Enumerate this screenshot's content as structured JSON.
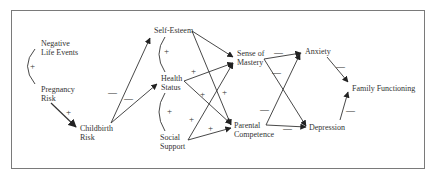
{
  "diagram": {
    "type": "path-model",
    "nodes": {
      "negative_life_events": {
        "line1": "Negative",
        "line2": "Life Events"
      },
      "pregnancy_risk": {
        "line1": "Pregnancy",
        "line2": "Risk"
      },
      "childbirth_risk": {
        "line1": "Childbirth",
        "line2": "Risk"
      },
      "self_esteem": {
        "line1": "Self-Esteem"
      },
      "health_status": {
        "line1": "Health",
        "line2": "Status"
      },
      "social_support": {
        "line1": "Social",
        "line2": "Support"
      },
      "sense_of_mastery": {
        "line1": "Sense of",
        "line2": "Mastery"
      },
      "parental_competence": {
        "line1": "Parental",
        "line2": "Competence"
      },
      "anxiety": {
        "line1": "Anxiety"
      },
      "depression": {
        "line1": "Depression"
      },
      "family_functioning": {
        "line1": "Family Functioning"
      }
    },
    "signs": {
      "plus": "+",
      "minus": "—"
    },
    "edges": [
      {
        "from": "Negative Life Events",
        "to": "Pregnancy Risk",
        "kind": "correlation",
        "sign": "+"
      },
      {
        "from": "Pregnancy Risk",
        "to": "Childbirth Risk",
        "kind": "path",
        "sign": "+"
      },
      {
        "from": "Childbirth Risk",
        "to": "Self-Esteem",
        "kind": "path",
        "sign": "−"
      },
      {
        "from": "Childbirth Risk",
        "to": "Health Status",
        "kind": "path",
        "sign": "−"
      },
      {
        "from": "Self-Esteem",
        "to": "Health Status",
        "kind": "correlation",
        "sign": "+"
      },
      {
        "from": "Health Status",
        "to": "Social Support",
        "kind": "correlation",
        "sign": "+"
      },
      {
        "from": "Self-Esteem",
        "to": "Sense of Mastery",
        "kind": "path",
        "sign": ""
      },
      {
        "from": "Self-Esteem",
        "to": "Parental Competence",
        "kind": "path",
        "sign": "+"
      },
      {
        "from": "Health Status",
        "to": "Sense of Mastery",
        "kind": "path",
        "sign": "+"
      },
      {
        "from": "Health Status",
        "to": "Parental Competence",
        "kind": "path",
        "sign": "+"
      },
      {
        "from": "Social Support",
        "to": "Sense of Mastery",
        "kind": "path",
        "sign": "+"
      },
      {
        "from": "Social Support",
        "to": "Parental Competence",
        "kind": "path",
        "sign": "+"
      },
      {
        "from": "Sense of Mastery",
        "to": "Anxiety",
        "kind": "path",
        "sign": "−"
      },
      {
        "from": "Sense of Mastery",
        "to": "Depression",
        "kind": "path",
        "sign": "−"
      },
      {
        "from": "Parental Competence",
        "to": "Anxiety",
        "kind": "path",
        "sign": "−"
      },
      {
        "from": "Parental Competence",
        "to": "Depression",
        "kind": "path",
        "sign": "−"
      },
      {
        "from": "Anxiety",
        "to": "Family Functioning",
        "kind": "path",
        "sign": "−"
      },
      {
        "from": "Depression",
        "to": "Family Functioning",
        "kind": "path",
        "sign": "−"
      }
    ]
  }
}
